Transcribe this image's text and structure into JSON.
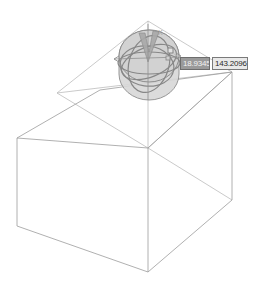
{
  "app": {
    "view_mode": "3D Isometric Wireframe",
    "background_color": "#ffffff"
  },
  "scene": {
    "name": "rotate-transform-scene",
    "wireframe_color": "#9a9a9a",
    "guide_color": "#b4b4b4",
    "axis_color": "#9e9e9e",
    "box": {
      "name": "wireframe-box",
      "label": "Box"
    },
    "gizmo": {
      "name": "rotation-gizmo",
      "label": "Rotate Gizmo",
      "sphere_fill": "#d6d6d6",
      "sphere_stroke": "#8d8d8d",
      "arc_color": "#8a8a8a",
      "wedge_fill": "#a8a8a8",
      "handle_color": "#8f8f8f",
      "axis_letter_x": "X",
      "axis_letter_y": "Y"
    }
  },
  "measurements": {
    "angle_field": {
      "name": "angle-input",
      "value": "18.9345",
      "placeholder": "0.0000",
      "selected": true
    },
    "reference_field": {
      "name": "reference-angle-input",
      "value": "143.2096",
      "placeholder": "0.0000",
      "selected": false
    }
  }
}
